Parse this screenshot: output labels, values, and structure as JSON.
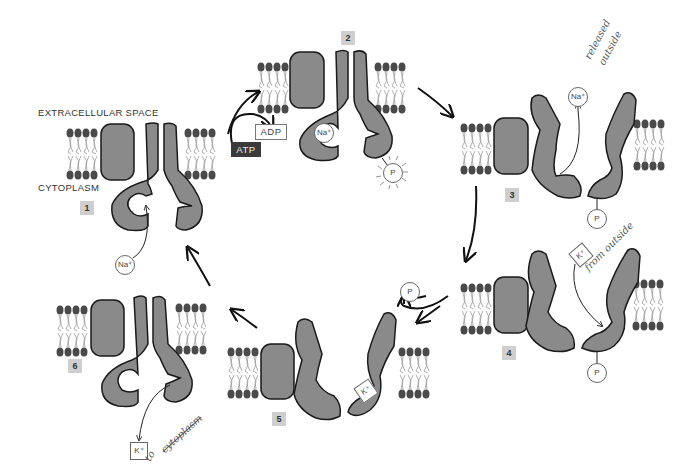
{
  "diagram": {
    "regions": {
      "extracellular": "EXTRACELLULAR SPACE",
      "cytoplasm": "CYTOPLASM"
    },
    "stages": [
      {
        "id": 1,
        "label": "1",
        "ions": [
          "Na+"
        ]
      },
      {
        "id": 2,
        "label": "2",
        "ions": [
          "Na+",
          "P"
        ]
      },
      {
        "id": 3,
        "label": "3",
        "ions": [
          "Na+",
          "P"
        ]
      },
      {
        "id": 4,
        "label": "4",
        "ions": [
          "K+",
          "P"
        ]
      },
      {
        "id": 5,
        "label": "5",
        "ions": [
          "P",
          "K+"
        ]
      },
      {
        "id": 6,
        "label": "6",
        "ions": [
          "K+"
        ]
      }
    ],
    "energy": {
      "atp": "ATP",
      "adp": "ADP"
    },
    "ions": {
      "sodium": "Na⁺",
      "potassium": "K⁺",
      "phosphate": "P"
    },
    "annotations": {
      "stage3": [
        "released",
        "outside"
      ],
      "stage4": "from outside",
      "stage6": [
        "to",
        "cytoplasm"
      ]
    },
    "colors": {
      "protein_fill": "#8a8a8a",
      "protein_stroke": "#1a1a1a",
      "lipid_head": "#4a4a4a",
      "lipid_tail": "#999999",
      "label_box": "#cfcfcf",
      "atp_box": "#3a3a3a"
    }
  }
}
